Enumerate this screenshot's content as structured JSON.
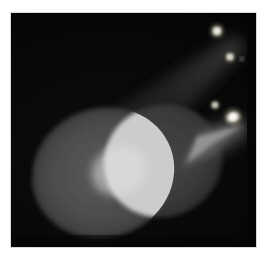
{
  "scene": {
    "title": "Overlapping spotlight beams on a dark floor",
    "media_type": "photograph",
    "frame": {
      "border_label": "white photo border",
      "border_color": "#ffffff",
      "photo_left": 11,
      "photo_top": 13,
      "photo_width": 245,
      "photo_height": 234
    },
    "background": {
      "label": "dark floor",
      "color": "#050505"
    },
    "colors": {
      "background": "#050505",
      "beam_haze_dim": "#2b2b2b",
      "beam_haze_bright": "#5a5a5a",
      "pool_left": "#4a4a4a",
      "pool_right": "#3d3d3d",
      "pool_overlap": "#d4d4d4",
      "light_source": "#fdfdf2",
      "border": "#ffffff"
    },
    "light_sources": [
      {
        "name": "lamp-upper",
        "x": 213,
        "y": 20,
        "radius": 4,
        "intensity": 0.95
      },
      {
        "name": "lamp-upper-small",
        "x": 224,
        "y": 45,
        "radius": 2,
        "intensity": 0.7
      },
      {
        "name": "lamp-lower",
        "x": 228,
        "y": 108,
        "radius": 5,
        "intensity": 1.0
      },
      {
        "name": "lamp-lower-small",
        "x": 214,
        "y": 96,
        "radius": 2,
        "intensity": 0.6
      }
    ],
    "beams": [
      {
        "name": "beam-left",
        "origin_x": 220,
        "origin_y": 24,
        "pool_cx": 92,
        "pool_cy": 160,
        "pool_rx": 72,
        "pool_ry": 65,
        "rotation_deg": -20,
        "haze_opacity": 0.22
      },
      {
        "name": "beam-right",
        "origin_x": 231,
        "origin_y": 110,
        "pool_cx": 152,
        "pool_cy": 148,
        "pool_rx": 60,
        "pool_ry": 56,
        "rotation_deg": -20,
        "haze_opacity": 0.3
      }
    ],
    "overlap": {
      "name": "beam-overlap-region",
      "label": "bright lens-shaped intersection",
      "color": "#d4d4d4"
    }
  }
}
